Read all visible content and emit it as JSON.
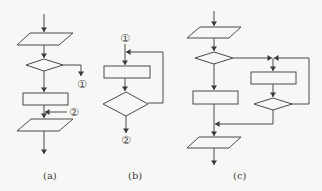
{
  "diagram": {
    "type": "flowchart-structures",
    "colors": {
      "line": "#4a4a4a",
      "background": "#f7f7f5"
    },
    "panels": [
      {
        "id": "a",
        "caption": "(a)",
        "description": "selection structure with exit connector",
        "connectors": {
          "out": "①",
          "in": "②"
        },
        "shapes": [
          "input-output",
          "decision",
          "process",
          "input-output"
        ]
      },
      {
        "id": "b",
        "caption": "(b)",
        "description": "loop structure (do-while)",
        "connectors": {
          "in": "①",
          "out": "②"
        },
        "shapes": [
          "process",
          "decision"
        ]
      },
      {
        "id": "c",
        "caption": "(c)",
        "description": "selection with nested loop branch",
        "connectors": {},
        "shapes": [
          "input-output",
          "decision",
          "process",
          "process",
          "decision",
          "input-output"
        ]
      }
    ]
  }
}
